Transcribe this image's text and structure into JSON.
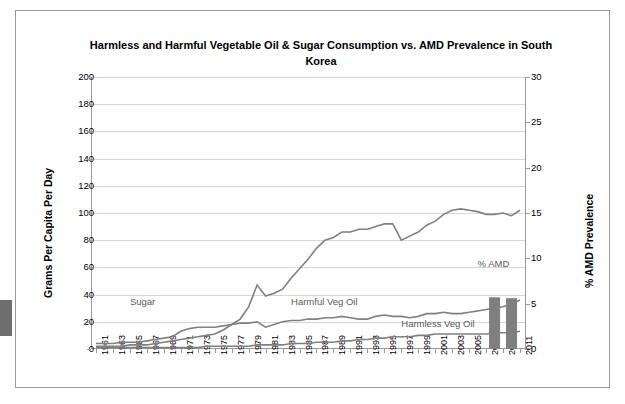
{
  "chart_data": {
    "type": "line",
    "title": "Harmless and Harmful Vegetable Oil & Sugar Consumption vs. AMD Prevalence in South Korea",
    "xlabel": "",
    "ylabel": "Grams Per Capita Per Day",
    "ylabel_right": "% AMD Prevalence",
    "ylim": [
      0,
      200
    ],
    "ylim_right": [
      0,
      30
    ],
    "yticks": [
      0,
      20,
      40,
      60,
      80,
      100,
      120,
      140,
      160,
      180,
      200
    ],
    "yticks_right": [
      0,
      5,
      10,
      15,
      20,
      25,
      30
    ],
    "grid": true,
    "legend_position": "inline-annotations",
    "annotations": [
      {
        "text": "Sugar",
        "x": 1965,
        "y": 34
      },
      {
        "text": "Harmful Veg Oil",
        "x": 1984,
        "y": 34
      },
      {
        "text": "Harmless Veg Oil",
        "x": 1997,
        "y": 18
      },
      {
        "text": "% AMD",
        "x": 2006,
        "y": 62
      }
    ],
    "x": [
      1961,
      1962,
      1963,
      1964,
      1965,
      1966,
      1967,
      1968,
      1969,
      1970,
      1971,
      1972,
      1973,
      1974,
      1975,
      1976,
      1977,
      1978,
      1979,
      1980,
      1981,
      1982,
      1983,
      1984,
      1985,
      1986,
      1987,
      1988,
      1989,
      1990,
      1991,
      1992,
      1993,
      1994,
      1995,
      1996,
      1997,
      1998,
      1999,
      2000,
      2001,
      2002,
      2003,
      2004,
      2005,
      2006,
      2007,
      2008,
      2009,
      2010,
      2011
    ],
    "xtick_labels": [
      1961,
      1963,
      1965,
      1967,
      1969,
      1971,
      1973,
      1975,
      1977,
      1979,
      1981,
      1983,
      1985,
      1987,
      1989,
      1991,
      1993,
      1995,
      1997,
      1999,
      2001,
      2003,
      2005,
      2007,
      2009,
      2011
    ],
    "series": [
      {
        "name": "Sugar",
        "color": "#808080",
        "axis": "left",
        "values": [
          4,
          4,
          4,
          5,
          5,
          5,
          6,
          7,
          8,
          9,
          13,
          15,
          16,
          16,
          16,
          17,
          18,
          19,
          19,
          20,
          16,
          18,
          20,
          21,
          21,
          22,
          22,
          23,
          23,
          24,
          23,
          22,
          22,
          24,
          25,
          24,
          24,
          23,
          24,
          26,
          26,
          27,
          26,
          26,
          27,
          28,
          29,
          30,
          31,
          33,
          36
        ]
      },
      {
        "name": "Harmful Veg Oil",
        "color": "#808080",
        "axis": "left",
        "values": [
          2,
          2,
          2,
          2,
          3,
          3,
          3,
          4,
          5,
          6,
          7,
          8,
          9,
          10,
          11,
          14,
          18,
          22,
          31,
          47,
          39,
          41,
          44,
          52,
          59,
          66,
          74,
          80,
          82,
          86,
          86,
          88,
          88,
          90,
          92,
          92,
          80,
          83,
          86,
          91,
          94,
          99,
          102,
          103,
          102,
          101,
          99,
          99,
          100,
          98,
          102
        ]
      },
      {
        "name": "Harmless Veg Oil",
        "color": "#808080",
        "axis": "left",
        "values": [
          1,
          1,
          1,
          1,
          1,
          1,
          1,
          1,
          1,
          1,
          1,
          1,
          1,
          2,
          2,
          2,
          2,
          2,
          2,
          3,
          3,
          3,
          3,
          4,
          4,
          4,
          5,
          5,
          5,
          6,
          6,
          7,
          7,
          8,
          8,
          9,
          9,
          9,
          10,
          10,
          11,
          11,
          11,
          11,
          11,
          11,
          11,
          12,
          12,
          12,
          13
        ]
      },
      {
        "name": "% AMD",
        "color": "#7f7f7f",
        "axis": "right",
        "type": "bar",
        "points": [
          {
            "x": 2008,
            "y": 5.7
          },
          {
            "x": 2010,
            "y": 5.6
          }
        ]
      }
    ]
  }
}
